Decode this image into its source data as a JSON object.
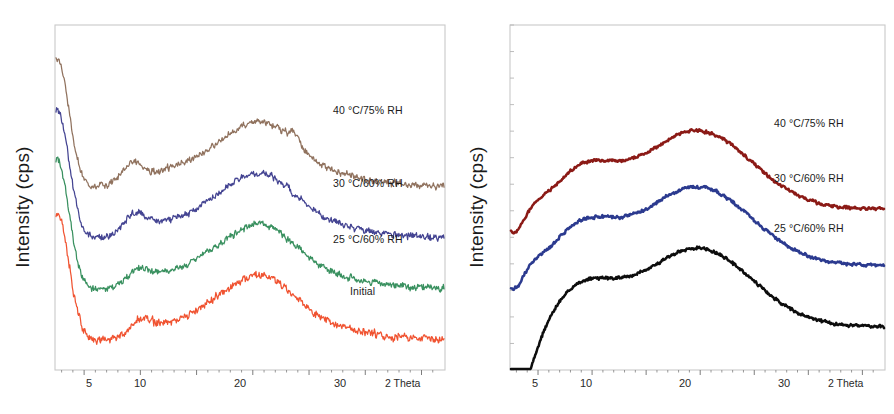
{
  "figure": {
    "background": "#ffffff",
    "panel_count": 2
  },
  "chart_data": [
    {
      "type": "line",
      "panel": "left",
      "title": "",
      "xlabel": "2 Theta",
      "ylabel": "Intensity (cps)",
      "xlim": [
        2.5,
        37
      ],
      "ylim": [
        0,
        100
      ],
      "grid": false,
      "axis_ticks_x": [
        5,
        10,
        20,
        30
      ],
      "axis_ticks_y_labeled": false,
      "legend": "inline-right",
      "noise_level": "high",
      "series": [
        {
          "name": "40 °C/75% RH",
          "color": "#8a6a55",
          "label_x": 2.5,
          "offset": 62,
          "peaks": [
            {
              "two_theta": 9.0,
              "type": "sharp"
            },
            {
              "two_theta": 19.5,
              "type": "broad-halo"
            },
            {
              "two_theta": 23.7,
              "type": "sharp-small"
            }
          ]
        },
        {
          "name": "30 °C/60% RH",
          "color": "#3a3a8c",
          "label_x": 2.5,
          "offset": 42,
          "peaks": [
            {
              "two_theta": 9.5,
              "type": "sharp"
            },
            {
              "two_theta": 19.8,
              "type": "broad-halo"
            }
          ]
        },
        {
          "name": "25 °C/60% RH",
          "color": "#2f8b57",
          "label_x": 2.5,
          "offset": 22,
          "peaks": [
            {
              "two_theta": 9.8,
              "type": "shoulder"
            },
            {
              "two_theta": 19.5,
              "type": "broad-halo"
            }
          ]
        },
        {
          "name": "Initial",
          "color": "#ef4a26",
          "label_x": 2.5,
          "offset": 2,
          "peaks": [
            {
              "two_theta": 10.0,
              "type": "shoulder"
            },
            {
              "two_theta": 20.0,
              "type": "broad-halo"
            }
          ]
        }
      ]
    },
    {
      "type": "line",
      "panel": "right",
      "title": "",
      "xlabel": "2 Theta",
      "ylabel": "Intensity (cps)",
      "xlim": [
        2.5,
        37
      ],
      "ylim": [
        0,
        100
      ],
      "grid": false,
      "axis_ticks_x": [
        5,
        10,
        20,
        30
      ],
      "axis_ticks_y_labeled": false,
      "legend": "inline-right",
      "noise_level": "low",
      "series": [
        {
          "name": "40 °C/75% RH",
          "color": "#8b1a16",
          "offset": 52,
          "peaks": [
            {
              "two_theta": 8.8,
              "type": "broad-halo"
            },
            {
              "two_theta": 19.0,
              "type": "broad-halo"
            }
          ]
        },
        {
          "name": "30 °C/60% RH",
          "color": "#2b3a8f",
          "offset": 30,
          "peaks": [
            {
              "two_theta": 8.8,
              "type": "broad-halo"
            },
            {
              "two_theta": 19.0,
              "type": "broad-halo"
            }
          ]
        },
        {
          "name": "25 °C/60% RH",
          "color": "#0d0d0d",
          "offset": 6,
          "peaks": [
            {
              "two_theta": 8.8,
              "type": "broad-halo"
            },
            {
              "two_theta": 19.0,
              "type": "broad-halo"
            }
          ]
        }
      ]
    }
  ],
  "panel_left": {
    "ylabel": "Intensity (cps)",
    "xaxis_name": "2 Theta",
    "ticks": [
      {
        "value": "5"
      },
      {
        "value": "10"
      },
      {
        "value": "20"
      },
      {
        "value": "30"
      }
    ],
    "curve_labels": [
      {
        "text": "40 °C/75% RH"
      },
      {
        "text": "30 °C/60% RH"
      },
      {
        "text": "25 °C/60% RH"
      },
      {
        "text": "Initial"
      }
    ]
  },
  "panel_right": {
    "ylabel": "Intensity (cps)",
    "xaxis_name": "2 Theta",
    "ticks": [
      {
        "value": "5"
      },
      {
        "value": "10"
      },
      {
        "value": "20"
      },
      {
        "value": "30"
      }
    ],
    "curve_labels": [
      {
        "text": "40 °C/75% RH"
      },
      {
        "text": "30 °C/60% RH"
      },
      {
        "text": "25 °C/60% RH"
      }
    ]
  }
}
